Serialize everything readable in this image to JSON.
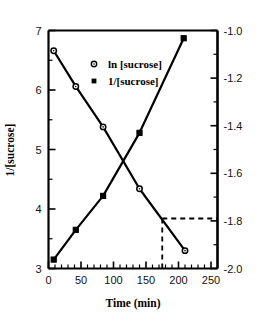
{
  "chart_data": {
    "type": "line",
    "title": "",
    "xlabel": "Time (min)",
    "ylabel_left": "1/[sucrose]",
    "ylabel_right": "",
    "xlim": [
      0,
      260
    ],
    "xticks": [
      0,
      50,
      100,
      150,
      200,
      250
    ],
    "xtick_labels": [
      "0",
      "50",
      "100",
      "150",
      "200",
      "250"
    ],
    "ylim_left": [
      3,
      7
    ],
    "yticks_left": [
      3,
      4,
      5,
      6,
      7
    ],
    "ytick_labels_left": [
      "3",
      "4",
      "5",
      "6",
      "7"
    ],
    "ylim_right": [
      -2.0,
      -1.0
    ],
    "yticks_right": [
      -2.0,
      -1.8,
      -1.6,
      -1.4,
      -1.2,
      -1.0
    ],
    "ytick_labels_right": [
      "-2.0",
      "-1.8",
      "-1.6",
      "-1.4",
      "-1.2",
      "-1.0"
    ],
    "grid": false,
    "legend_position": "upper-center",
    "series": [
      {
        "name": "ln [sucrose]",
        "marker": "open-circle",
        "axis": "right",
        "x": [
          8,
          42,
          84,
          140,
          210
        ],
        "y": [
          -1.085,
          -1.235,
          -1.405,
          -1.665,
          -1.925
        ]
      },
      {
        "name": "1/[sucrose]",
        "marker": "filled-square",
        "axis": "left",
        "x": [
          8,
          42,
          84,
          140,
          208
        ],
        "y": [
          3.15,
          3.65,
          4.22,
          5.28,
          6.87
        ]
      }
    ],
    "annotations": [
      {
        "name": "dashed-reference",
        "style": "dashed",
        "x_value": 175,
        "y_value_right": -1.79,
        "description": "vertical dashed line at t=175 meeting horizontal dashed line at -1.79 on right axis"
      }
    ]
  },
  "legend": {
    "entries": [
      {
        "label": "ln [sucrose]",
        "marker": "open-circle"
      },
      {
        "label": "1/[sucrose]",
        "marker": "filled-square"
      }
    ]
  },
  "axes": {
    "x_title": "Time (min)",
    "y_left_title": "1/[sucrose]"
  },
  "colors": {
    "line": "#000000",
    "frame": "#000000",
    "background": "#ffffff",
    "text": "#111111"
  }
}
